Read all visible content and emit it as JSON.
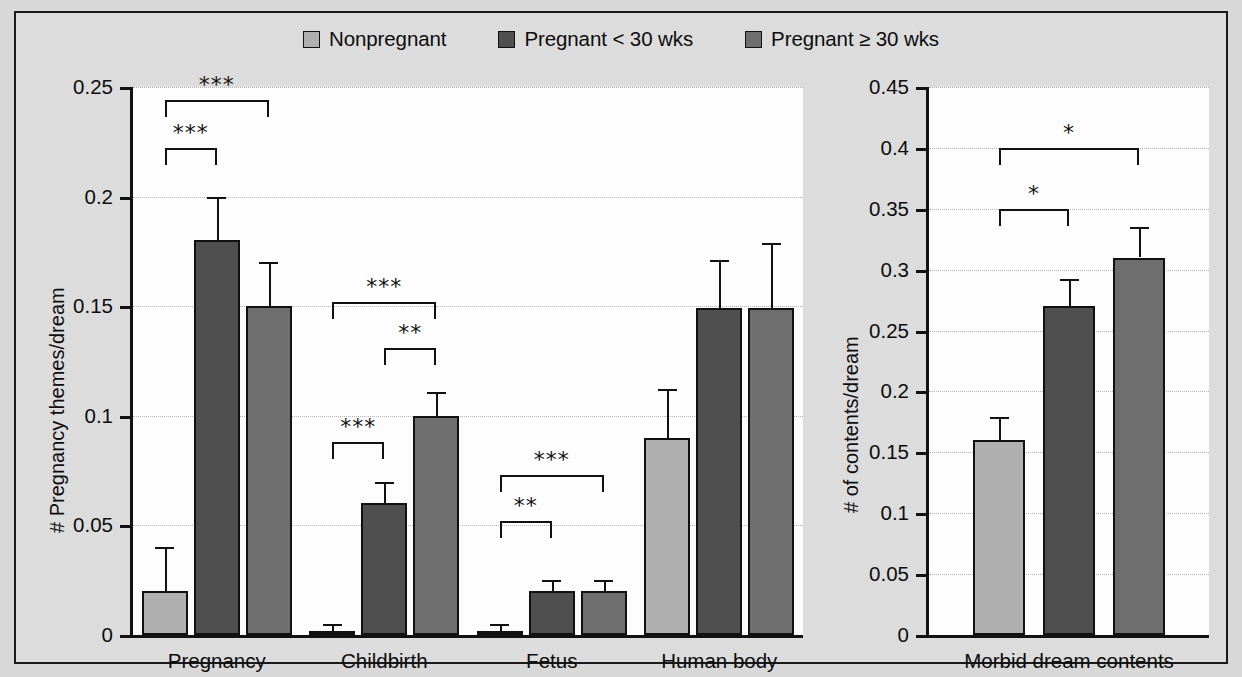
{
  "figure": {
    "background_color": "#dcdcdc",
    "plot_background_color": "#fdfdfd",
    "frame_color": "#1a1a1a"
  },
  "legend": {
    "position": "top-center",
    "items": [
      {
        "label": "Nonpregnant",
        "color": "#b0b0b0"
      },
      {
        "label": "Pregnant < 30 wks",
        "color": "#4f4f4f"
      },
      {
        "label": "Pregnant ≥ 30 wks",
        "color": "#6e6e6e"
      }
    ]
  },
  "chart_data": [
    {
      "type": "bar",
      "panel": "left",
      "title": "",
      "xlabel": "",
      "ylabel": "# Pregnancy themes/dream",
      "ylim": [
        0,
        0.25
      ],
      "yticks": [
        "0",
        "0.05",
        "0.1",
        "0.15",
        "0.2",
        "0.25"
      ],
      "ytick_values": [
        0,
        0.05,
        0.1,
        0.15,
        0.2,
        0.25
      ],
      "grid": true,
      "categories": [
        "Pregnancy",
        "Childbirth",
        "Fetus",
        "Human body"
      ],
      "series": [
        {
          "name": "Nonpregnant",
          "values": [
            0.02,
            0.001,
            0.001,
            0.09
          ],
          "errors": [
            0.02,
            0.004,
            0.004,
            0.022
          ]
        },
        {
          "name": "Pregnant < 30 wks",
          "values": [
            0.18,
            0.06,
            0.02,
            0.149
          ],
          "errors": [
            0.02,
            0.01,
            0.005,
            0.022
          ]
        },
        {
          "name": "Pregnant ≥ 30 wks",
          "values": [
            0.15,
            0.1,
            0.02,
            0.149
          ],
          "errors": [
            0.02,
            0.011,
            0.005,
            0.03
          ]
        }
      ],
      "annotations": [
        {
          "group": "Pregnancy",
          "from": 0,
          "to": 2,
          "label": "***",
          "y": 0.244
        },
        {
          "group": "Pregnancy",
          "from": 0,
          "to": 1,
          "label": "***",
          "y": 0.222
        },
        {
          "group": "Childbirth",
          "from": 0,
          "to": 2,
          "label": "***",
          "y": 0.152
        },
        {
          "group": "Childbirth",
          "from": 1,
          "to": 2,
          "label": "**",
          "y": 0.131
        },
        {
          "group": "Childbirth",
          "from": 0,
          "to": 1,
          "label": "***",
          "y": 0.088
        },
        {
          "group": "Fetus",
          "from": 0,
          "to": 2,
          "label": "***",
          "y": 0.073
        },
        {
          "group": "Fetus",
          "from": 0,
          "to": 1,
          "label": "**",
          "y": 0.052
        }
      ]
    },
    {
      "type": "bar",
      "panel": "right",
      "title": "",
      "xlabel": "",
      "ylabel": "# of contents/dream",
      "ylim": [
        0,
        0.45
      ],
      "yticks": [
        "0",
        "0.05",
        "0.1",
        "0.15",
        "0.2",
        "0.25",
        "0.3",
        "0.35",
        "0.4",
        "0.45"
      ],
      "ytick_values": [
        0,
        0.05,
        0.1,
        0.15,
        0.2,
        0.25,
        0.3,
        0.35,
        0.4,
        0.45
      ],
      "grid": true,
      "categories": [
        "Morbid dream contents"
      ],
      "series": [
        {
          "name": "Nonpregnant",
          "values": [
            0.16
          ],
          "errors": [
            0.019
          ]
        },
        {
          "name": "Pregnant < 30 wks",
          "values": [
            0.27
          ],
          "errors": [
            0.022
          ]
        },
        {
          "name": "Pregnant ≥ 30 wks",
          "values": [
            0.31
          ],
          "errors": [
            0.025
          ]
        }
      ],
      "annotations": [
        {
          "group": "Morbid dream contents",
          "from": 0,
          "to": 2,
          "label": "*",
          "y": 0.4
        },
        {
          "group": "Morbid dream contents",
          "from": 0,
          "to": 1,
          "label": "*",
          "y": 0.35
        }
      ]
    }
  ]
}
